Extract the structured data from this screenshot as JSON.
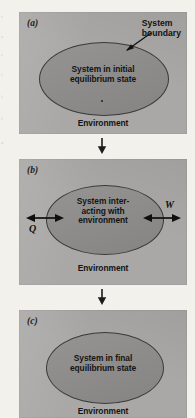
{
  "figure": {
    "type": "thermodynamic-system-process-diagram",
    "panels": [
      {
        "id": "a",
        "label": "(a)",
        "system_text_lines": [
          "System in initial",
          "equilibrium state"
        ],
        "environment_label": "Environment",
        "callout": {
          "lines": [
            "System",
            "boundary"
          ],
          "points_to": "ellipse-outline"
        },
        "energy_arrows": []
      },
      {
        "id": "b",
        "label": "(b)",
        "system_text_lines": [
          "System inter-",
          "acting with",
          "environment"
        ],
        "environment_label": "Environment",
        "callout": null,
        "energy_arrows": [
          {
            "symbol": "Q",
            "side": "left",
            "style": "double-headed"
          },
          {
            "symbol": "W",
            "side": "right",
            "style": "double-headed"
          }
        ]
      },
      {
        "id": "c",
        "label": "(c)",
        "system_text_lines": [
          "System in final",
          "equilibrium state"
        ],
        "environment_label": "Environment",
        "callout": null,
        "energy_arrows": []
      }
    ],
    "flow_arrows": [
      {
        "from": "a",
        "to": "b",
        "direction": "down"
      },
      {
        "from": "b",
        "to": "c",
        "direction": "down"
      }
    ],
    "colors": {
      "page_background": "#f3f1ec",
      "panel_fill": "#a9a8a6",
      "ellipse_fill": "#8d8c8a",
      "ellipse_stroke": "#3a3a3a",
      "text": "#141414"
    }
  },
  "margin_bleed": [
    "r",
    "s",
    "e",
    "t",
    "i",
    "f",
    "n"
  ]
}
